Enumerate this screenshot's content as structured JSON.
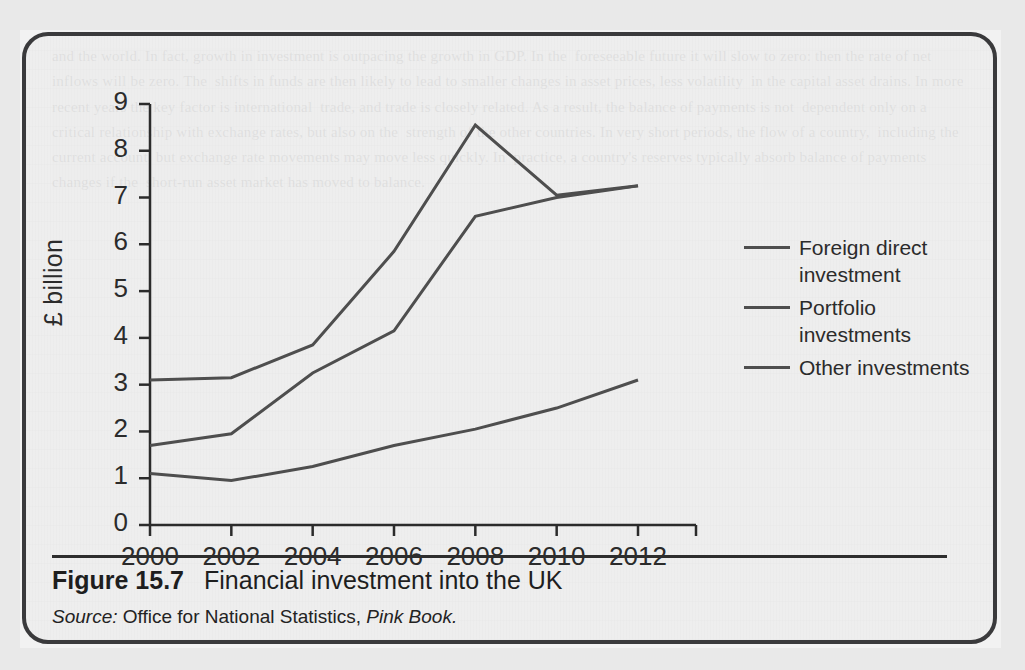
{
  "figure": {
    "number_label": "Figure 15.7",
    "title": "Financial investment into the UK",
    "source_label": "Source:",
    "source_text": "Office for National Statistics,",
    "source_publication": "Pink Book."
  },
  "chart_data": {
    "type": "line",
    "title": "Financial investment into the UK",
    "xlabel": "",
    "ylabel": "£ billion",
    "x": [
      2000,
      2002,
      2004,
      2006,
      2008,
      2010,
      2012
    ],
    "categories": [
      "2000",
      "2002",
      "2004",
      "2006",
      "2008",
      "2010",
      "2012"
    ],
    "xlim": [
      2000,
      2012
    ],
    "ylim": [
      0,
      9
    ],
    "yticks": [
      0,
      1,
      2,
      3,
      4,
      5,
      6,
      7,
      8,
      9
    ],
    "ytick_labels": [
      "0",
      "1",
      "2",
      "3",
      "4",
      "5",
      "6",
      "7",
      "8",
      "9"
    ],
    "grid": false,
    "legend_position": "right",
    "series": [
      {
        "name": "Foreign direct investment",
        "color": "#4e4e4e",
        "values": [
          1.1,
          0.95,
          1.25,
          1.7,
          2.05,
          2.5,
          3.1
        ]
      },
      {
        "name": "Portfolio investments",
        "color": "#4e4e4e",
        "values": [
          3.1,
          3.15,
          3.85,
          5.85,
          8.55,
          7.05,
          7.25
        ]
      },
      {
        "name": "Other investments",
        "color": "#4e4e4e",
        "values": [
          1.7,
          1.95,
          3.25,
          4.15,
          6.6,
          7.0,
          7.25
        ]
      }
    ]
  },
  "legend": {
    "items": [
      {
        "label": "Foreign direct investment"
      },
      {
        "label": "Portfolio investments"
      },
      {
        "label": "Other investments"
      }
    ]
  },
  "background_text": "and the world. In fact, growth in investment is outpacing the growth in GDP. In the  foreseeable future it will slow to zero: then the rate of net inflows will be zero. The  shifts in funds are then likely to lead to smaller changes in asset prices, less volatility  in the capital asset drains. In more recent years the key factor is international  trade, and trade is closely related. As a result, the balance of payments is not  dependent only on a critical relationship with exchange rates, but also on the  strength of the other countries. In very short periods, the flow of a country,  including the current account, but exchange rate movements may move less quickly. In  practice, a country's reserves typically absorb balance of payments changes if the  short-run asset market has moved to balance.",
  "background_heading": "Influence of buying and selling of currency reserves"
}
